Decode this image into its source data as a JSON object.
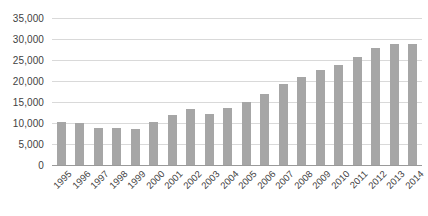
{
  "chart_data": {
    "type": "bar",
    "title": "",
    "subtitle": "",
    "xlabel": "",
    "ylabel": "",
    "categories": [
      "1995",
      "1996",
      "1997",
      "1998",
      "1999",
      "2000",
      "2001",
      "2002",
      "2003",
      "2004",
      "2005",
      "2006",
      "2007",
      "2008",
      "2009",
      "2010",
      "2011",
      "2012",
      "2013",
      "2014"
    ],
    "values": [
      10300,
      10000,
      8900,
      8700,
      8600,
      10200,
      12000,
      13300,
      12200,
      13600,
      15000,
      16900,
      19400,
      21000,
      22600,
      23900,
      25700,
      27800,
      28700,
      28800
    ],
    "series": [
      {
        "name": "",
        "values": [
          10300,
          10000,
          8900,
          8700,
          8600,
          10200,
          12000,
          13300,
          12200,
          13600,
          15000,
          16900,
          19400,
          21000,
          22600,
          23900,
          25700,
          27800,
          28700,
          28800
        ]
      }
    ],
    "ylim": [
      0,
      35000
    ],
    "ytick_values": [
      0,
      5000,
      10000,
      15000,
      20000,
      25000,
      30000,
      35000
    ],
    "ytick_labels": [
      "0",
      "5,000",
      "10,000",
      "15,000",
      "20,000",
      "25,000",
      "30,000",
      "35,000"
    ],
    "grid": "horizontal",
    "legend": "none",
    "annotations": [],
    "colors": {
      "bar": "#a6a6a6",
      "gridline": "#d9d9d9",
      "axis": "#9a9a9a",
      "tick_label": "#3f3f3f",
      "background": "#ffffff"
    }
  }
}
